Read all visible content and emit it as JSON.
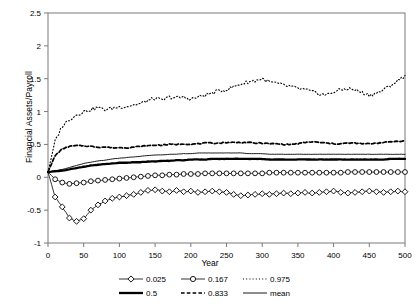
{
  "chart_data": {
    "type": "line",
    "title": "",
    "xlabel": "Year",
    "ylabel": "Financial Assets/Payroll",
    "xlim": [
      0,
      500
    ],
    "ylim": [
      -1,
      2.5
    ],
    "xticks": [
      0,
      50,
      100,
      150,
      200,
      250,
      300,
      350,
      400,
      450,
      500
    ],
    "yticks": [
      -1,
      -0.5,
      0,
      0.5,
      1,
      1.5,
      2,
      2.5
    ],
    "xticklabels": [
      "0",
      "50",
      "100",
      "150",
      "200",
      "250",
      "300",
      "350",
      "400",
      "450",
      "500"
    ],
    "yticklabels": [
      "-1",
      "-0.5",
      "0",
      "0.5",
      "1",
      "1.5",
      "2",
      "2.5"
    ],
    "grid": false,
    "legend_position": "bottom",
    "x": [
      0,
      10,
      20,
      30,
      40,
      50,
      60,
      70,
      80,
      90,
      100,
      110,
      120,
      130,
      140,
      150,
      160,
      170,
      180,
      190,
      200,
      210,
      220,
      230,
      240,
      250,
      260,
      270,
      280,
      290,
      300,
      310,
      320,
      330,
      340,
      350,
      360,
      370,
      380,
      390,
      400,
      410,
      420,
      430,
      440,
      450,
      460,
      470,
      480,
      490,
      500
    ],
    "series": [
      {
        "name": "0.025",
        "style": "solid-thin-diamond",
        "marker": "diamond",
        "values": [
          0.08,
          -0.3,
          -0.45,
          -0.62,
          -0.67,
          -0.63,
          -0.5,
          -0.42,
          -0.36,
          -0.32,
          -0.3,
          -0.28,
          -0.26,
          -0.23,
          -0.2,
          -0.19,
          -0.21,
          -0.22,
          -0.2,
          -0.22,
          -0.21,
          -0.23,
          -0.22,
          -0.21,
          -0.22,
          -0.23,
          -0.26,
          -0.28,
          -0.27,
          -0.26,
          -0.25,
          -0.26,
          -0.25,
          -0.24,
          -0.25,
          -0.24,
          -0.23,
          -0.24,
          -0.23,
          -0.22,
          -0.21,
          -0.23,
          -0.24,
          -0.23,
          -0.22,
          -0.21,
          -0.22,
          -0.23,
          -0.22,
          -0.21,
          -0.22
        ]
      },
      {
        "name": "0.167",
        "style": "solid-thin-circle",
        "marker": "circle",
        "values": [
          0.08,
          -0.03,
          -0.08,
          -0.1,
          -0.09,
          -0.08,
          -0.06,
          -0.05,
          -0.04,
          -0.03,
          -0.02,
          -0.01,
          0.0,
          0.01,
          0.02,
          0.03,
          0.03,
          0.04,
          0.04,
          0.05,
          0.05,
          0.05,
          0.06,
          0.06,
          0.06,
          0.06,
          0.06,
          0.06,
          0.06,
          0.06,
          0.06,
          0.07,
          0.07,
          0.07,
          0.07,
          0.07,
          0.07,
          0.07,
          0.07,
          0.07,
          0.07,
          0.07,
          0.08,
          0.08,
          0.08,
          0.08,
          0.08,
          0.08,
          0.08,
          0.08,
          0.08
        ]
      },
      {
        "name": "0.975",
        "style": "dotted",
        "marker": "none",
        "values": [
          0.08,
          0.55,
          0.78,
          0.88,
          0.95,
          1.0,
          1.03,
          1.06,
          1.03,
          1.05,
          1.07,
          1.08,
          1.1,
          1.12,
          1.17,
          1.2,
          1.17,
          1.22,
          1.21,
          1.22,
          1.19,
          1.22,
          1.25,
          1.28,
          1.32,
          1.33,
          1.38,
          1.42,
          1.45,
          1.47,
          1.5,
          1.45,
          1.43,
          1.4,
          1.38,
          1.35,
          1.33,
          1.3,
          1.27,
          1.25,
          1.3,
          1.33,
          1.35,
          1.33,
          1.29,
          1.25,
          1.28,
          1.33,
          1.4,
          1.47,
          1.55
        ]
      },
      {
        "name": "0.5",
        "style": "solid-thick",
        "marker": "none",
        "values": [
          0.08,
          0.09,
          0.1,
          0.12,
          0.14,
          0.16,
          0.18,
          0.19,
          0.2,
          0.21,
          0.22,
          0.22,
          0.23,
          0.23,
          0.24,
          0.24,
          0.25,
          0.25,
          0.26,
          0.26,
          0.27,
          0.27,
          0.27,
          0.28,
          0.28,
          0.28,
          0.28,
          0.28,
          0.28,
          0.28,
          0.28,
          0.27,
          0.27,
          0.27,
          0.27,
          0.27,
          0.27,
          0.27,
          0.27,
          0.27,
          0.27,
          0.27,
          0.27,
          0.27,
          0.27,
          0.27,
          0.27,
          0.27,
          0.28,
          0.28,
          0.28
        ]
      },
      {
        "name": "0.833",
        "style": "dashed",
        "marker": "none",
        "values": [
          0.08,
          0.33,
          0.43,
          0.47,
          0.48,
          0.48,
          0.47,
          0.46,
          0.46,
          0.45,
          0.45,
          0.45,
          0.46,
          0.47,
          0.48,
          0.49,
          0.49,
          0.5,
          0.5,
          0.51,
          0.5,
          0.51,
          0.52,
          0.52,
          0.52,
          0.53,
          0.53,
          0.53,
          0.53,
          0.52,
          0.52,
          0.51,
          0.51,
          0.5,
          0.5,
          0.51,
          0.53,
          0.54,
          0.53,
          0.52,
          0.51,
          0.51,
          0.52,
          0.52,
          0.51,
          0.51,
          0.52,
          0.53,
          0.54,
          0.55,
          0.55
        ]
      },
      {
        "name": "mean",
        "style": "solid-thin",
        "marker": "none",
        "values": [
          0.08,
          0.1,
          0.12,
          0.15,
          0.18,
          0.21,
          0.23,
          0.25,
          0.26,
          0.28,
          0.29,
          0.3,
          0.31,
          0.32,
          0.33,
          0.34,
          0.34,
          0.35,
          0.35,
          0.36,
          0.36,
          0.37,
          0.37,
          0.37,
          0.37,
          0.37,
          0.37,
          0.37,
          0.36,
          0.36,
          0.36,
          0.35,
          0.35,
          0.35,
          0.35,
          0.35,
          0.35,
          0.35,
          0.35,
          0.35,
          0.35,
          0.35,
          0.35,
          0.35,
          0.35,
          0.35,
          0.35,
          0.35,
          0.35,
          0.35,
          0.35
        ]
      }
    ],
    "legend": [
      {
        "label": "0.025",
        "style": "solid-thin-diamond"
      },
      {
        "label": "0.167",
        "style": "solid-thin-circle"
      },
      {
        "label": "0.975",
        "style": "dotted"
      },
      {
        "label": "0.5",
        "style": "solid-thick"
      },
      {
        "label": "0.833",
        "style": "dashed"
      },
      {
        "label": "mean",
        "style": "solid-thin"
      }
    ]
  }
}
